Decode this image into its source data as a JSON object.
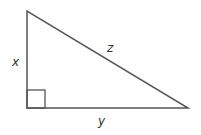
{
  "diagram": {
    "type": "right-triangle",
    "stroke_color": "#555555",
    "vertices": {
      "top": [
        27,
        11
      ],
      "right_angle": [
        27,
        108
      ],
      "right": [
        188,
        108
      ]
    },
    "right_angle_marker": {
      "x": 27,
      "y": 90,
      "size": 18
    },
    "labels": {
      "vertical_leg": "x",
      "horizontal_leg": "y",
      "hypotenuse": "z"
    }
  }
}
